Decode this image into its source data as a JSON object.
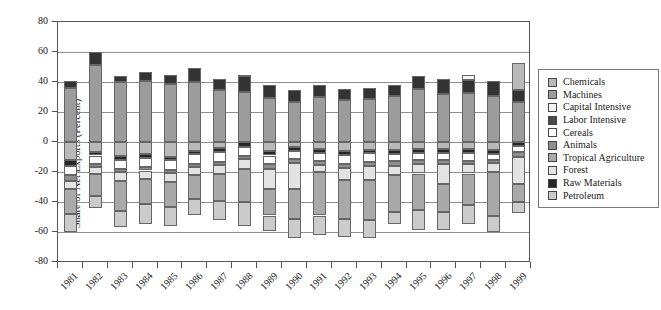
{
  "chart_data": {
    "type": "bar",
    "subtype": "stacked-bar-grayscale",
    "title": "",
    "xlabel": "",
    "ylabel": "Share of Net Exports (Percent)",
    "ylim": [
      -80,
      80
    ],
    "ytick_step": 20,
    "ytick_labels": [
      "80",
      "60",
      "40",
      "20",
      "0",
      "-20",
      "-40",
      "-60",
      "-80"
    ],
    "grid": "horizontal",
    "legend_position": "right",
    "categories": [
      "1981",
      "1982",
      "1983",
      "1984",
      "1985",
      "1986",
      "1987",
      "1988",
      "1989",
      "1990",
      "1991",
      "1992",
      "1993",
      "1994",
      "1995",
      "1996",
      "1997",
      "1998",
      "1999"
    ],
    "stack_order_note": "series listed in stacking order from the zero axis outward (positives up, negatives down)",
    "series": [
      {
        "name": "Machines",
        "color": "#9c9c9c",
        "values": [
          36,
          51.5,
          40,
          40.5,
          38.5,
          40,
          34.5,
          33.5,
          29.5,
          26.5,
          30,
          28,
          28.5,
          31,
          35.5,
          32,
          33,
          31,
          27
        ]
      },
      {
        "name": "Labor Intensive",
        "color": "#333333",
        "values": [
          5,
          8.5,
          4,
          6,
          6.5,
          9.5,
          7.5,
          10.5,
          8.5,
          8,
          8,
          7.5,
          7.5,
          7,
          8.5,
          10,
          8.5,
          9.5,
          7.5
        ]
      },
      {
        "name": "Capital Intensive",
        "color": "#f4f4f4",
        "values": [
          0,
          0,
          0,
          0,
          0,
          0,
          0,
          0,
          0,
          0,
          0,
          0,
          0,
          0,
          0,
          0,
          3.5,
          0,
          0
        ]
      },
      {
        "name": "Chemicals",
        "color": "#b9b9b9",
        "values": [
          -12.3,
          -6.8,
          -9,
          -7.9,
          -9.7,
          -5.7,
          -4,
          1,
          -6.3,
          -3.5,
          -4.5,
          -6,
          -5,
          -5.2,
          -4.7,
          -4.7,
          -4.7,
          -5.2,
          18.5
        ]
      },
      {
        "name": "Raw Materials",
        "color": "#262626",
        "values": [
          -3.4,
          -2.2,
          -2.9,
          -2.6,
          -2.6,
          -2.6,
          -2.5,
          -3,
          -2.7,
          -2.6,
          -2.6,
          -2.5,
          -2.5,
          -2.7,
          -2.6,
          -2.8,
          -2.6,
          -2.7,
          -2.5
        ]
      },
      {
        "name": "Cereals",
        "color": "#ffffff",
        "values": [
          -6.6,
          -5.5,
          -6,
          -6.3,
          -6.2,
          -6.2,
          -6.5,
          -6,
          -5.5,
          -5.1,
          -5.5,
          -6,
          -6,
          -4.9,
          -4.9,
          -4.2,
          -5.1,
          -4.1,
          -4.4
        ]
      },
      {
        "name": "Animals",
        "color": "#8e8e8e",
        "values": [
          -3.4,
          -2.3,
          -2.2,
          -2.2,
          -2.3,
          -2.3,
          -2.3,
          -2.2,
          -3.4,
          -2.7,
          -2.5,
          -2.5,
          -2.5,
          -2.9,
          -2.6,
          -2.7,
          -2.2,
          -2.2,
          -3
        ]
      },
      {
        "name": "Forest",
        "color": "#e3e3e3",
        "values": [
          -5.5,
          -4.4,
          -5.6,
          -5.5,
          -6,
          -5.5,
          -6,
          -6.7,
          -13.3,
          -17.3,
          -5,
          -8,
          -9,
          -6.6,
          -6.2,
          -13.5,
          -6.4,
          -5.8,
          -17.8
        ]
      },
      {
        "name": "Tropical Agriculture",
        "color": "#a9a9a9",
        "values": [
          -16.7,
          -15,
          -20,
          -16.7,
          -16.7,
          -15.6,
          -18,
          -22,
          -17.8,
          -20,
          -28.9,
          -26,
          -27,
          -24.5,
          -24.2,
          -18.9,
          -21.3,
          -29,
          -12.3
        ]
      },
      {
        "name": "Petroleum",
        "color": "#cbcbcb",
        "values": [
          -12.2,
          -7.7,
          -11.1,
          -13.3,
          -12.8,
          -11.1,
          -12.5,
          -16,
          -10,
          -12.9,
          -13,
          -12,
          -12,
          -7.7,
          -13.3,
          -11.7,
          -12.2,
          -11.1,
          -7
        ]
      }
    ],
    "legend": [
      {
        "label": "Chemicals",
        "swatch_color": "#b9b9b9"
      },
      {
        "label": "Machines",
        "swatch_color": "#9c9c9c"
      },
      {
        "label": "Capital Intensive",
        "swatch_color": "#f4f4f4"
      },
      {
        "label": "Labor Intensive",
        "swatch_color": "#4a4a4a"
      },
      {
        "label": "Cereals",
        "swatch_color": "#ffffff"
      },
      {
        "label": "Animals",
        "swatch_color": "#8e8e8e"
      },
      {
        "label": "Tropical Agriculture",
        "swatch_color": "#a9a9a9"
      },
      {
        "label": "Forest",
        "swatch_color": "#e3e3e3"
      },
      {
        "label": "Raw Materials",
        "swatch_color": "#262626"
      },
      {
        "label": "Petroleum",
        "swatch_color": "#cbcbcb"
      }
    ]
  }
}
